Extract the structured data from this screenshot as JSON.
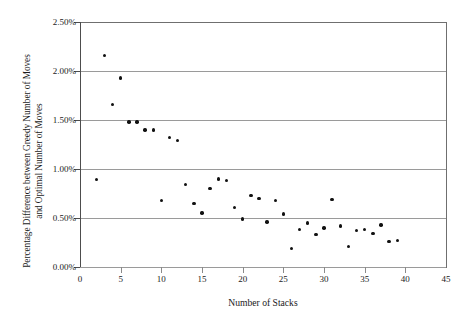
{
  "chart_data": {
    "type": "scatter",
    "title": "",
    "xlabel": "Number of Stacks",
    "ylabel_line1": "Percentage Difference between Greedy Number of Moves",
    "ylabel_line2": "and Optimal Number of Moves",
    "xlim": [
      0,
      45
    ],
    "ylim": [
      0,
      2.5
    ],
    "xticks": [
      0,
      5,
      10,
      15,
      20,
      25,
      30,
      35,
      40,
      45
    ],
    "xtick_labels": [
      "0",
      "5",
      "10",
      "15",
      "20",
      "25",
      "30",
      "35",
      "40",
      "45"
    ],
    "yticks": [
      0.0,
      0.5,
      1.0,
      1.5,
      2.0,
      2.5
    ],
    "ytick_labels": [
      "0.00%",
      "0.50%",
      "1.00%",
      "1.50%",
      "2.00%",
      "2.50%"
    ],
    "grid": "horizontal",
    "legend": "none",
    "marker": "filled-circle",
    "marker_color": "#111111",
    "grid_color": "#9a9a9a",
    "axis_color": "#4d4d4d",
    "x": [
      2,
      3,
      4,
      5,
      6,
      7,
      8,
      9,
      10,
      11,
      12,
      13,
      14,
      15,
      16,
      17,
      18,
      19,
      20,
      21,
      22,
      23,
      24,
      25,
      26,
      27,
      28,
      29,
      30,
      31,
      32,
      33,
      34,
      35,
      36,
      37,
      38,
      39
    ],
    "y": [
      0.89,
      2.16,
      1.66,
      1.93,
      1.48,
      1.48,
      1.4,
      1.4,
      0.68,
      1.32,
      1.29,
      0.84,
      0.65,
      0.55,
      0.8,
      0.9,
      0.88,
      0.61,
      0.49,
      0.73,
      0.7,
      0.46,
      0.68,
      0.54,
      0.19,
      0.38,
      0.45,
      0.33,
      0.4,
      0.69,
      0.42,
      0.21,
      0.37,
      0.38,
      0.34,
      0.43,
      0.26,
      0.27
    ],
    "points": [
      {
        "x": 2,
        "y": 0.89
      },
      {
        "x": 3,
        "y": 2.16
      },
      {
        "x": 4,
        "y": 1.66
      },
      {
        "x": 5,
        "y": 1.93
      },
      {
        "x": 6,
        "y": 1.48
      },
      {
        "x": 7,
        "y": 1.48
      },
      {
        "x": 8,
        "y": 1.4
      },
      {
        "x": 9,
        "y": 1.4
      },
      {
        "x": 10,
        "y": 0.68
      },
      {
        "x": 11,
        "y": 1.32
      },
      {
        "x": 12,
        "y": 1.29
      },
      {
        "x": 13,
        "y": 0.84
      },
      {
        "x": 14,
        "y": 0.65
      },
      {
        "x": 15,
        "y": 0.55
      },
      {
        "x": 16,
        "y": 0.8
      },
      {
        "x": 17,
        "y": 0.9
      },
      {
        "x": 18,
        "y": 0.88
      },
      {
        "x": 19,
        "y": 0.61
      },
      {
        "x": 20,
        "y": 0.49
      },
      {
        "x": 21,
        "y": 0.73
      },
      {
        "x": 22,
        "y": 0.7
      },
      {
        "x": 23,
        "y": 0.46
      },
      {
        "x": 24,
        "y": 0.68
      },
      {
        "x": 25,
        "y": 0.54
      },
      {
        "x": 26,
        "y": 0.19
      },
      {
        "x": 27,
        "y": 0.38
      },
      {
        "x": 28,
        "y": 0.45
      },
      {
        "x": 29,
        "y": 0.33
      },
      {
        "x": 30,
        "y": 0.4
      },
      {
        "x": 31,
        "y": 0.69
      },
      {
        "x": 32,
        "y": 0.42
      },
      {
        "x": 33,
        "y": 0.21
      },
      {
        "x": 34,
        "y": 0.37
      },
      {
        "x": 35,
        "y": 0.38
      },
      {
        "x": 36,
        "y": 0.34
      },
      {
        "x": 37,
        "y": 0.43
      },
      {
        "x": 38,
        "y": 0.26
      },
      {
        "x": 39,
        "y": 0.27
      }
    ]
  }
}
